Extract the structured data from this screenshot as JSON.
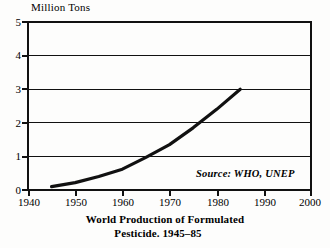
{
  "chart_data": {
    "type": "line",
    "title": "World Production of Formulated Pesticide. 1945–85",
    "title_line1": "World Production of Formulated",
    "title_line2": "Pesticide. 1945–85",
    "xlabel": "",
    "ylabel": "Million Tons",
    "ylim": [
      0,
      5
    ],
    "xlim": [
      1940,
      2000
    ],
    "ytick_labels": [
      "0",
      "1",
      "2",
      "3",
      "4",
      "5"
    ],
    "yticks": [
      0,
      1,
      2,
      3,
      4,
      5
    ],
    "xtick_labels": [
      "1940",
      "1950",
      "1960",
      "1970",
      "1980",
      "1990",
      "2000"
    ],
    "xticks": [
      1940,
      1950,
      1960,
      1970,
      1980,
      1990,
      2000
    ],
    "grid": "horizontal",
    "legend": "none",
    "annotation": "Source: WHO, UNEP",
    "series": [
      {
        "name": "World production of formulated pesticide",
        "x": [
          1945,
          1950,
          1955,
          1960,
          1965,
          1970,
          1975,
          1980,
          1985
        ],
        "values": [
          0.1,
          0.22,
          0.4,
          0.62,
          0.97,
          1.35,
          1.85,
          2.4,
          3.0
        ]
      }
    ]
  },
  "axis": {
    "y_caption": "Million Tons",
    "y_tick_0": "0",
    "y_tick_1": "1",
    "y_tick_2": "2",
    "y_tick_3": "3",
    "y_tick_4": "4",
    "y_tick_5": "5",
    "x_tick_1940": "1940",
    "x_tick_1950": "1950",
    "x_tick_1960": "1960",
    "x_tick_1970": "1970",
    "x_tick_1980": "1980",
    "x_tick_1990": "1990",
    "x_tick_2000": "2000"
  },
  "annotations": {
    "source": "Source: WHO, UNEP"
  },
  "title": {
    "line1": "World Production of Formulated",
    "line2": "Pesticide. 1945–85"
  },
  "colors": {
    "ink": "#111111",
    "background": "#fdfdfc"
  }
}
